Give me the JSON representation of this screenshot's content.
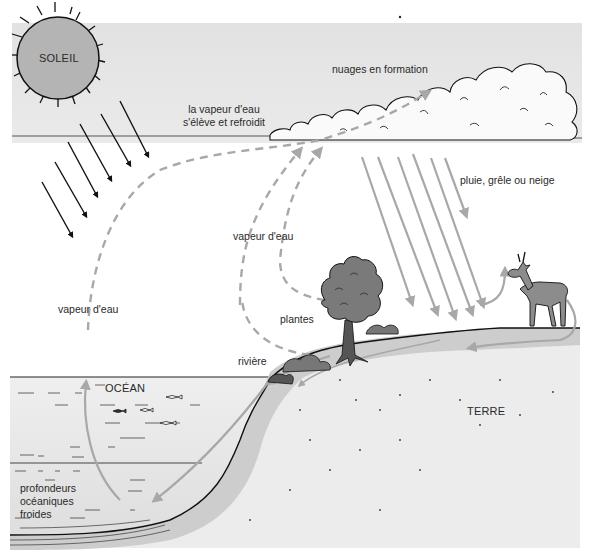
{
  "diagram": {
    "type": "water-cycle",
    "colors": {
      "sky": "#e6e6e6",
      "ocean_surface": "#ececec",
      "ocean_deep": "#dcdcdc",
      "land": "#e8e8e8",
      "soil_band": "#cfcfcf",
      "gray_arrow": "#a8a8a8",
      "sun_fill": "#b4b4b4",
      "ink": "#111111",
      "tree": "#7a7a7a",
      "deer": "#8c8c8c"
    },
    "labels": {
      "sun": "SOLEIL",
      "vapor_rises": [
        "la vapeur d'eau",
        "s'élève et refroidit"
      ],
      "clouds": "nuages en formation",
      "precipitation": "pluie, grêle ou neige",
      "vapor_plants": "vapeur d'eau",
      "vapor_ocean": "vapeur d'eau",
      "plants": "plantes",
      "river": "rivière",
      "ocean": "OCÉAN",
      "land": "TERRE",
      "deep_ocean": [
        "profondeurs",
        "océaniques",
        "froides"
      ]
    },
    "icons": {
      "sun": "sun-icon",
      "cloud": "cloud-icon",
      "tree": "tree-icon",
      "deer": "deer-icon",
      "fish": "fish-icon",
      "sun_rays": "sunlight-arrow-icon",
      "rain": "rain-arrow-icon",
      "vapor": "dashed-arrow-icon"
    }
  }
}
